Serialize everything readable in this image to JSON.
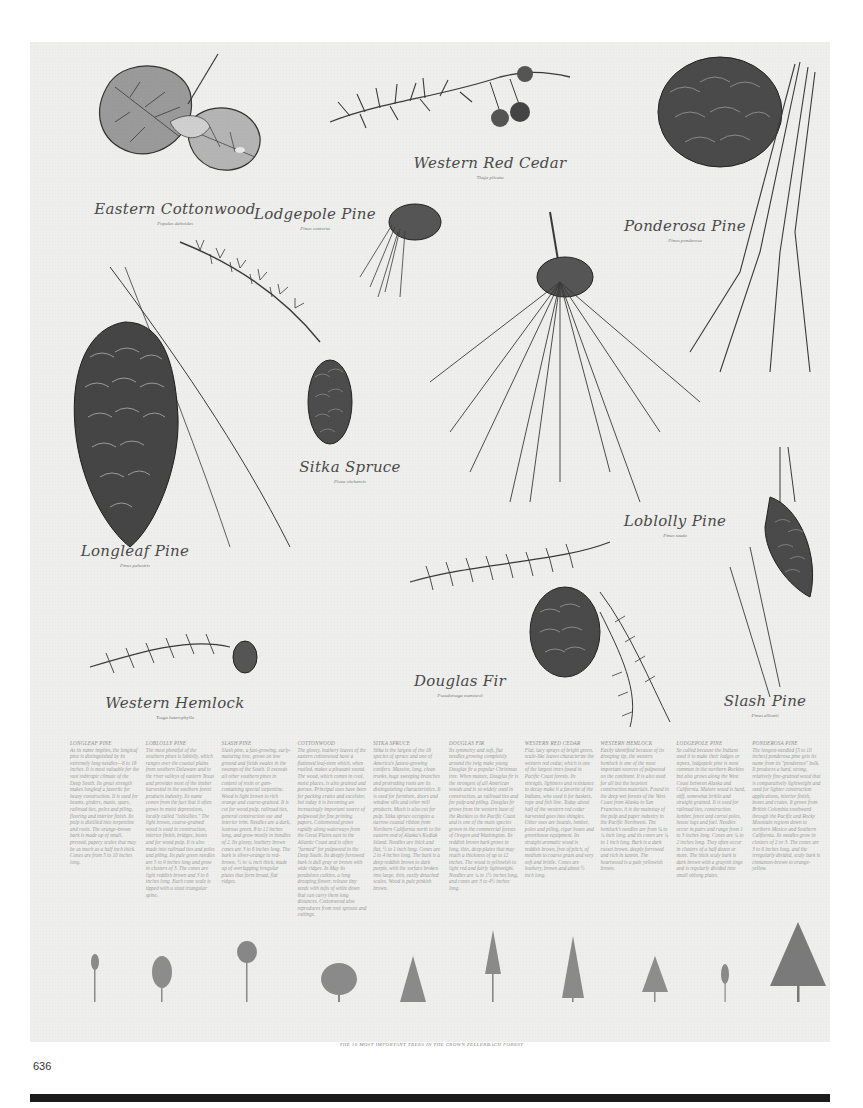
{
  "poster": {
    "specimens": [
      {
        "common": "Eastern Cottonwood",
        "latin": "Populus deltoides"
      },
      {
        "common": "Western Red Cedar",
        "latin": "Thuja plicata"
      },
      {
        "common": "Lodgepole Pine",
        "latin": "Pinus contorta"
      },
      {
        "common": "Ponderosa Pine",
        "latin": "Pinus ponderosa"
      },
      {
        "common": "Sitka Spruce",
        "latin": "Picea sitchensis"
      },
      {
        "common": "Loblolly Pine",
        "latin": "Pinus taeda"
      },
      {
        "common": "Longleaf Pine",
        "latin": "Pinus palustris"
      },
      {
        "common": "Douglas Fir",
        "latin": "Pseudotsuga menziesii"
      },
      {
        "common": "Western Hemlock",
        "latin": "Tsuga heterophylla"
      },
      {
        "common": "Slash Pine",
        "latin": "Pinus elliottii"
      }
    ],
    "descriptions": [
      {
        "title": "Longleaf Pine",
        "body": "As its name implies, the longleaf pine is distinguished by its extremely long needles—8 to 18 inches. It is most valuable for the vast subtropic climate of the Deep South. Its great strength makes longleaf a favorite for heavy construction. It is used for beams, girders, masts, spars, railroad ties, poles and piling, flooring and interior finish. Its pulp is distilled into turpentine and rosin. The orange-brown bark is made up of small, pressed, papery scales that may be as much as a half inch thick. Cones are from 5 to 10 inches long."
      },
      {
        "title": "Loblolly Pine",
        "body": "The most plentiful of the southern pines is loblolly, which ranges over the coastal plains from southern Delaware and to the river valleys of eastern Texas and provides most of the timber harvested in the southern forest products industry. Its name comes from the fact that it often grows in moist depressions, locally called \"loblollies.\" The light brown, coarse-grained wood is used in construction, interior finish, bridges, boxes and for wood pulp. It is also made into railroad ties and poles and piling. Its pale green needles are 5 to 9 inches long and grow in clusters of 3. The cones are light reddish brown and 3 to 6 inches long. Each cone scale is tipped with a stout triangular spine."
      },
      {
        "title": "Slash Pine",
        "body": "Slash pine, a fast-growing, early-maturing tree, grows on low ground and fields swales in the swamps of the South. It exceeds all other southern pines in content of resin or gum-containing special turpentine. Wood is light brown to rich orange and coarse-grained. It is cut for wood pulp, railroad ties, general construction use and interior trim. Needles are a dark, lustrous green, 8 to 12 inches long, and grow mostly in bundles of 2. Its glossy, leathery brown cones are 3 to 6 inches long. The bark is silver-orange to red-brown, ½ to ¾ inch thick, made up of overlapping irregular plates that form broad, flat ridges."
      },
      {
        "title": "Cottonwood",
        "body": "The glossy, leathery leaves of the eastern cottonwood have a flattened leaf-stem which, when rustled, makes a pleasant sound. The wood, which comes in cool, moist places, is also grained and porous. Principal uses have been for packing crates and excelsior, but today it is becoming an increasingly important source of pulpwood for fine printing papers. Cottonwood grows rapidly along waterways from the Great Plains east to the Atlantic Coast and is often \"farmed\" for pulpwood in the Deep South. Its deeply furrowed bark is dull gray or brown with wide ridges. In May its pendulous catkins, a long drooping flower, release tiny seeds with tufts of white down that can carry them long distances. Cottonwood also reproduces from root sprouts and cuttings."
      },
      {
        "title": "Sitka Spruce",
        "body": "Sitka is the largest of the 18 species of spruce and one of America's fastest-growing conifers. Massive, long, clean trunks, huge sweeping branches and protruding roots are its distinguishing characteristics. It is used for furniture, doors and window sills and other mill products. Much is also cut for pulp. Sitka spruce occupies a narrow coastal ribbon from Northern California north to the eastern end of Alaska's Kodiak Island. Needles are thick and flat, ½ to 1 inch long. Cones are 2 to 4 inches long. The bark is a deep reddish brown to dark purple, with the surface broken into large, thin, easily detached scales. Wood is pale pinkish brown."
      },
      {
        "title": "Douglas Fir",
        "body": "Its symmetry and soft, flat needles growing completely around the twig make young Douglas fir a popular Christmas tree. When mature, Douglas fir is the strongest of all American woods and is so widely used in construction, as railroad ties and for pulp and piling. Douglas fir grows from the western base of the Rockies to the Pacific Coast and is one of the main species grown in the commercial forests of Oregon and Washington. Its reddish brown bark grows in long, thin, deep plates that may reach a thickness of up to 12 inches. The wood is yellowish to light red and fairly lightweight. Needles are ¾ to 1½ inches long, and cones are 3 to 4½ inches long."
      },
      {
        "title": "Western Red Cedar",
        "body": "Flat, lacy sprays of bright green, scale-like leaves characterize the western red cedar, which is one of the largest trees found in Pacific Coast forests. Its strength, lightness and resistance to decay make it a favorite of the Indians, who used it for baskets, rope and fish line. Today about half of the western red cedar harvested goes into shingles. Other uses are boards, lumber, poles and piling, cigar boxes and greenhouse equipment. Its straight aromatic wood is reddish brown, free of pitch, of medium to coarse grain and very soft and brittle. Cones are leathery, brown and about ½ inch long."
      },
      {
        "title": "Western Hemlock",
        "body": "Easily identified because of its drooping tip, the western hemlock is one of the most important sources of pulpwood on the continent. It is also used for all but the heaviest construction materials. Found in the deep wet forests of the West Coast from Alaska to San Francisco, it is the mainstay of the pulp and paper industry in the Pacific Northwest. The hemlock's needles are from ¼ to ¾ inch long, and its cones are ¾ to 1 inch long. Bark is a dark russet brown, deeply furrowed and rich in tannin. The heartwood is a pale yellowish brown."
      },
      {
        "title": "Lodgepole Pine",
        "body": "So called because the Indians used it to make their lodges or tepees, lodgepole pine is most common in the northern Rockies but also grows along the West Coast between Alaska and California. Mature wood is hard, stiff, somewhat brittle and straight grained. It is used for railroad ties, construction lumber, fence and corral poles, house logs and fuel. Needles occur in pairs and range from 1 to 3 inches long. Cones are ¾ to 2 inches long. They often occur in clusters of a half dozen or more. The thick scaly bark is dark brown with a grayish tinge and is regularly divided into small oblong plates."
      },
      {
        "title": "Ponderosa Pine",
        "body": "The longest-needled (5 to 10 inches) ponderosa pine gets its name from its \"ponderous\" bulk. It produces a hard, strong, relatively fine-grained wood that is comparatively lightweight and used for lighter construction applications, interior finish, boxes and crates. It grows from British Columbia southward through the Pacific and Rocky Mountain regions down to northern Mexico and Southern California. Its needles grow in clusters of 2 or 3. The cones are 3 to 6 inches long, and the irregularly divided, scaly bark is cinnamon-brown to orange-yellow."
      }
    ],
    "caption": "The 10 most important trees in the Crown Zellerbach forest"
  },
  "page": {
    "number": "636"
  }
}
